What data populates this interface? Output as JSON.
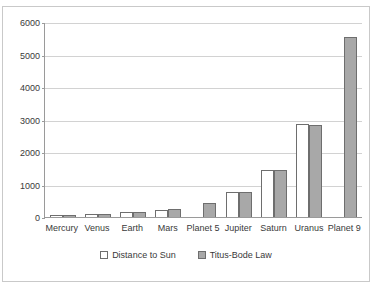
{
  "chart_data": {
    "type": "bar",
    "title": "",
    "xlabel": "",
    "ylabel": "",
    "ylim": [
      0,
      6000
    ],
    "yticks": [
      0,
      1000,
      2000,
      3000,
      4000,
      5000,
      6000
    ],
    "ytick_labels": [
      "0",
      "1000",
      "2000",
      "3000",
      "4000",
      "5000",
      "6000"
    ],
    "grid": true,
    "legend_position": "bottom",
    "categories": [
      "Mercury",
      "Venus",
      "Earth",
      "Mars",
      "Planet 5",
      "Jupiter",
      "Saturn",
      "Uranus",
      "Planet 9"
    ],
    "series": [
      {
        "name": "Distance to Sun",
        "color": "#ffffff",
        "values": [
          58,
          108,
          150,
          228,
          null,
          778,
          1433,
          2877,
          null
        ]
      },
      {
        "name": "Titus-Bode Law",
        "color": "#a8a8a8",
        "values": [
          55,
          105,
          150,
          240,
          420,
          765,
          1440,
          2820,
          5540
        ]
      }
    ]
  },
  "legend": {
    "items": [
      {
        "label": "Distance to Sun",
        "swatch": "legend-swatch-white"
      },
      {
        "label": "Titus-Bode Law",
        "swatch": "legend-swatch-gray"
      }
    ]
  },
  "colors": {
    "series_distance": "#ffffff",
    "series_titus": "#a8a8a8",
    "bar_border": "#6e6e6e",
    "axis": "#9a9a9a",
    "gridline": "#d2d2d2",
    "frame": "#c9c9c9",
    "text": "#3a3a3a"
  }
}
